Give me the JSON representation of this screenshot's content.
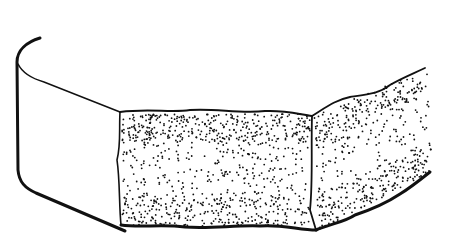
{
  "illustration": {
    "subject": "stippled bread slab cross-section",
    "width": 456,
    "height": 237,
    "background": "#ffffff",
    "ink": "#111111",
    "paths": {
      "outer_crust": "M40,38 C27,42 17,50 17,62 L18,170 C19,182 25,188 36,193 L125,231",
      "inner_crust_top": "M18,64 C22,72 30,78 44,82 L120,112",
      "front_top": "M120,112 C150,108 170,113 190,110 C215,108 240,114 265,111 C285,110 298,114 312,116",
      "front_left": "M120,112 C119,130 121,145 117,160 C120,180 119,205 121,225",
      "front_bottom": "M121,225 C140,228 160,224 185,227 C210,229 235,225 260,226 C280,224 300,230 316,230",
      "divider": "M312,116 C311,150 313,180 310,210 L316,230",
      "right_top": "M312,116 C325,108 335,100 350,97 C370,94 380,93 390,85 C400,79 410,75 425,68",
      "right_bottom": "M316,230 C330,224 345,222 355,215 C370,210 385,204 400,194 C410,188 420,180 430,172"
    },
    "stipple": {
      "front_face": {
        "x0": 122,
        "y0": 114,
        "x1": 310,
        "y1": 226,
        "count": 900
      },
      "right_face": {
        "count": 520
      },
      "dot_radius": 0.9,
      "seed": 7
    }
  }
}
